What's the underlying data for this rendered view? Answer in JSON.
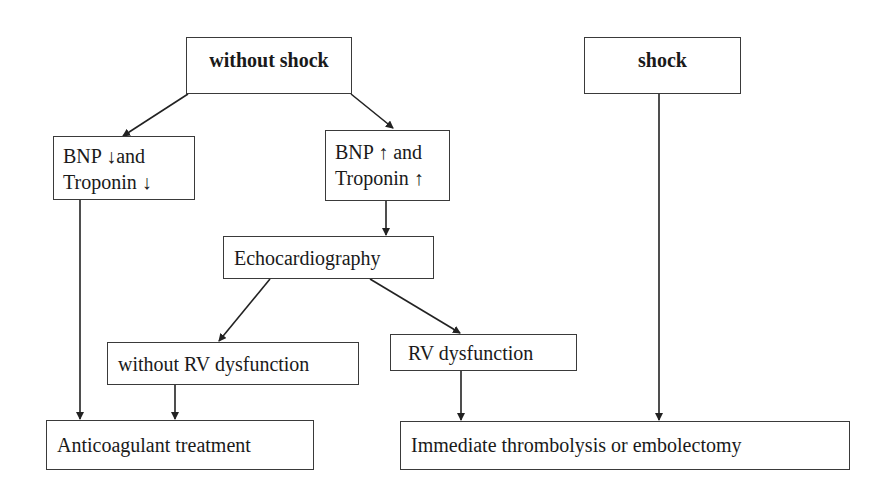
{
  "nodes": {
    "without_shock": "without shock",
    "shock": "shock",
    "bnp_low_line1": "BNP ↓and",
    "bnp_low_line2": "Troponin ↓",
    "bnp_high_line1": "BNP ↑ and",
    "bnp_high_line2": "Troponin ↑",
    "echo": "Echocardiography",
    "without_rv": "without RV dysfunction",
    "rv": "RV dysfunction",
    "anticoag": "Anticoagulant treatment",
    "immediate": "Immediate thrombolysis or embolectomy"
  },
  "edges": [
    [
      "without shock",
      "BNP ↓ and Troponin ↓"
    ],
    [
      "without shock",
      "BNP ↑ and Troponin ↑"
    ],
    [
      "BNP ↑ and Troponin ↑",
      "Echocardiography"
    ],
    [
      "Echocardiography",
      "without RV dysfunction"
    ],
    [
      "Echocardiography",
      "RV dysfunction"
    ],
    [
      "BNP ↓ and Troponin ↓",
      "Anticoagulant treatment"
    ],
    [
      "without RV dysfunction",
      "Anticoagulant treatment"
    ],
    [
      "RV dysfunction",
      "Immediate thrombolysis or embolectomy"
    ],
    [
      "shock",
      "Immediate thrombolysis or embolectomy"
    ]
  ]
}
